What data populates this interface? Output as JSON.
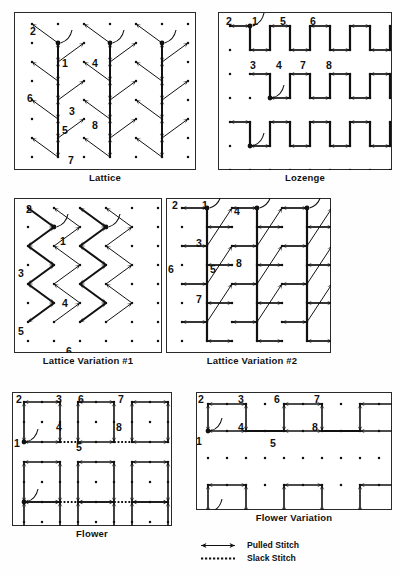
{
  "page": {
    "width": 400,
    "height": 577,
    "ink_color": "#111111",
    "paper_color": "#fefefe",
    "frame_color": "#2a2a2a"
  },
  "panels": [
    {
      "id": "lattice",
      "caption": "Lattice",
      "box": {
        "x": 14,
        "y": 12,
        "w": 182,
        "h": 158
      },
      "grid": {
        "cols": 7,
        "rows": 8,
        "dx": 26,
        "dy": 19,
        "ox": 18,
        "oy": 12
      },
      "step_labels": [
        {
          "n": "2",
          "x": 16,
          "y": 14
        },
        {
          "n": "1",
          "x": 48,
          "y": 46
        },
        {
          "n": "4",
          "x": 78,
          "y": 46
        },
        {
          "n": "6",
          "x": 13,
          "y": 81
        },
        {
          "n": "3",
          "x": 55,
          "y": 94
        },
        {
          "n": "5",
          "x": 48,
          "y": 113
        },
        {
          "n": "8",
          "x": 78,
          "y": 108
        },
        {
          "n": "7",
          "x": 54,
          "y": 143
        }
      ],
      "motif": "vertical-trunk-with-diagonal-branches"
    },
    {
      "id": "lozenge",
      "caption": "Lozenge",
      "box": {
        "x": 218,
        "y": 12,
        "w": 174,
        "h": 158
      },
      "grid": {
        "cols": 9,
        "rows": 7,
        "dx": 20,
        "dy": 24,
        "ox": 12,
        "oy": 14
      },
      "step_labels": [
        {
          "n": "2",
          "x": 8,
          "y": 4
        },
        {
          "n": "1",
          "x": 34,
          "y": 4
        },
        {
          "n": "5",
          "x": 62,
          "y": 4
        },
        {
          "n": "6",
          "x": 92,
          "y": 4
        },
        {
          "n": "3",
          "x": 32,
          "y": 48
        },
        {
          "n": "4",
          "x": 58,
          "y": 48
        },
        {
          "n": "7",
          "x": 82,
          "y": 48
        },
        {
          "n": "8",
          "x": 108,
          "y": 48
        }
      ],
      "motif": "square-bracket-rows"
    },
    {
      "id": "lattice-variation-1",
      "caption": "Lattice Variation #1",
      "box": {
        "x": 14,
        "y": 198,
        "w": 148,
        "h": 155
      },
      "grid": {
        "cols": 6,
        "rows": 8,
        "dx": 26,
        "dy": 19,
        "ox": 14,
        "oy": 10
      },
      "step_labels": [
        {
          "n": "2",
          "x": 12,
          "y": 6
        },
        {
          "n": "1",
          "x": 46,
          "y": 38
        },
        {
          "n": "3",
          "x": 4,
          "y": 70
        },
        {
          "n": "4",
          "x": 48,
          "y": 100
        },
        {
          "n": "5",
          "x": 4,
          "y": 128
        },
        {
          "n": "6",
          "x": 52,
          "y": 148
        }
      ],
      "motif": "chevron-zigzag"
    },
    {
      "id": "lattice-variation-2",
      "caption": "Lattice Variation #2",
      "box": {
        "x": 166,
        "y": 198,
        "w": 165,
        "h": 155
      },
      "grid": {
        "cols": 7,
        "rows": 8,
        "dx": 25,
        "dy": 19,
        "ox": 16,
        "oy": 10
      },
      "step_labels": [
        {
          "n": "2",
          "x": 6,
          "y": 2
        },
        {
          "n": "1",
          "x": 36,
          "y": 2
        },
        {
          "n": "4",
          "x": 68,
          "y": 8
        },
        {
          "n": "3",
          "x": 30,
          "y": 40
        },
        {
          "n": "6",
          "x": 2,
          "y": 66
        },
        {
          "n": "5",
          "x": 44,
          "y": 66
        },
        {
          "n": "8",
          "x": 70,
          "y": 60
        },
        {
          "n": "7",
          "x": 30,
          "y": 96
        }
      ],
      "motif": "vertical-horizontal-with-diagonals"
    },
    {
      "id": "flower",
      "caption": "Flower",
      "box": {
        "x": 12,
        "y": 392,
        "w": 160,
        "h": 134
      },
      "grid": {
        "cols": 9,
        "rows": 7,
        "dx": 18,
        "dy": 20,
        "ox": 12,
        "oy": 10
      },
      "step_labels": [
        {
          "n": "2",
          "x": 4,
          "y": 2
        },
        {
          "n": "3",
          "x": 44,
          "y": 2
        },
        {
          "n": "6",
          "x": 66,
          "y": 2
        },
        {
          "n": "7",
          "x": 106,
          "y": 2
        },
        {
          "n": "4",
          "x": 44,
          "y": 30
        },
        {
          "n": "8",
          "x": 104,
          "y": 30
        },
        {
          "n": "1",
          "x": 2,
          "y": 46
        },
        {
          "n": "5",
          "x": 64,
          "y": 50
        }
      ],
      "motif": "open-squares-with-slack-connectors"
    },
    {
      "id": "flower-variation",
      "caption": "Flower Variation",
      "box": {
        "x": 196,
        "y": 392,
        "w": 196,
        "h": 118
      },
      "grid": {
        "cols": 11,
        "rows": 5,
        "dx": 19,
        "dy": 27,
        "ox": 12,
        "oy": 12
      },
      "step_labels": [
        {
          "n": "2",
          "x": 2,
          "y": 2
        },
        {
          "n": "3",
          "x": 42,
          "y": 2
        },
        {
          "n": "6",
          "x": 78,
          "y": 2
        },
        {
          "n": "7",
          "x": 118,
          "y": 2
        },
        {
          "n": "4",
          "x": 42,
          "y": 30
        },
        {
          "n": "8",
          "x": 116,
          "y": 30
        },
        {
          "n": "1",
          "x": 0,
          "y": 44
        },
        {
          "n": "5",
          "x": 74,
          "y": 46
        }
      ],
      "motif": "open-squares-with-solid-connectors"
    }
  ],
  "legend": {
    "x": 196,
    "y": 540,
    "items": [
      {
        "symbol": "double-arrow-line",
        "label": "Pulled Stitch"
      },
      {
        "symbol": "dotted-line",
        "label": "Slack Stitch"
      }
    ]
  }
}
